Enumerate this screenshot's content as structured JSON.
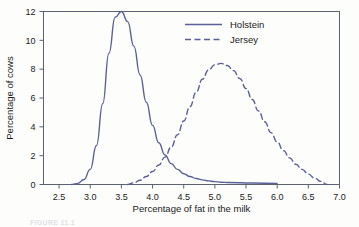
{
  "figure": {
    "background_color": "#fdfdfc",
    "caption_partial": "FIGURE 11.1"
  },
  "chart_data": {
    "type": "line",
    "title": "",
    "xlabel": "Percentage of fat in the milk",
    "ylabel": "Percentage of cows",
    "xlim": [
      2.25,
      7.0
    ],
    "ylim": [
      0,
      12
    ],
    "xticks": [
      2.5,
      3.0,
      3.5,
      4.0,
      4.5,
      5.0,
      5.5,
      6.0,
      6.5,
      7.0
    ],
    "xtick_labels": [
      "2.5",
      "3.0",
      "3.5",
      "4.0",
      "4.5",
      "5.0",
      "5.5",
      "6.0",
      "6.5",
      "7.0"
    ],
    "yticks": [
      0,
      2,
      4,
      6,
      8,
      10,
      12
    ],
    "ytick_labels": [
      "0",
      "2",
      "4",
      "6",
      "8",
      "10",
      "12"
    ],
    "grid": false,
    "legend_position": "top-right",
    "line_color": "#5a6199",
    "axis_color": "#5c6270",
    "series": [
      {
        "name": "Holstein",
        "style": "solid",
        "color": "#5a6199",
        "mean": 3.5,
        "sd": 0.23,
        "peak_x": 3.5,
        "peak_y": 12,
        "x": [
          2.7,
          2.8,
          2.9,
          3.0,
          3.1,
          3.2,
          3.3,
          3.4,
          3.5,
          3.6,
          3.7,
          3.8,
          3.9,
          4.0,
          4.1,
          4.2,
          4.3,
          4.4,
          4.5,
          4.6,
          4.7,
          4.8,
          4.9,
          5.0,
          5.1,
          5.2,
          5.6,
          6.0
        ],
        "values": [
          0.0,
          0.08,
          0.35,
          1.05,
          2.7,
          5.6,
          9.1,
          11.6,
          12.0,
          11.3,
          9.6,
          7.6,
          5.7,
          4.1,
          2.9,
          2.05,
          1.45,
          1.05,
          0.75,
          0.55,
          0.42,
          0.32,
          0.25,
          0.2,
          0.16,
          0.14,
          0.1,
          0.08
        ]
      },
      {
        "name": "Jersey",
        "style": "dashed",
        "color": "#5a6199",
        "mean": 5.1,
        "sd": 0.47,
        "peak_x": 5.1,
        "peak_y": 8.4,
        "x": [
          3.6,
          3.7,
          3.8,
          3.9,
          4.0,
          4.1,
          4.2,
          4.3,
          4.4,
          4.5,
          4.6,
          4.7,
          4.8,
          4.9,
          5.0,
          5.1,
          5.2,
          5.3,
          5.4,
          5.5,
          5.6,
          5.7,
          5.8,
          5.9,
          6.0,
          6.1,
          6.2,
          6.3,
          6.4,
          6.5,
          6.6,
          6.7,
          6.8
        ],
        "values": [
          0.0,
          0.12,
          0.3,
          0.55,
          0.9,
          1.35,
          1.9,
          2.6,
          3.45,
          4.4,
          5.4,
          6.4,
          7.3,
          7.95,
          8.3,
          8.4,
          8.25,
          7.9,
          7.35,
          6.65,
          5.9,
          5.1,
          4.35,
          3.6,
          2.95,
          2.35,
          1.85,
          1.4,
          1.05,
          0.72,
          0.45,
          0.22,
          0.0
        ]
      }
    ]
  },
  "axis": {
    "x_title": "Percentage of fat in the milk",
    "y_title": "Percentage of cows"
  },
  "legend": {
    "entries": [
      {
        "label": "Holstein",
        "style": "solid"
      },
      {
        "label": "Jersey",
        "style": "dashed"
      }
    ]
  }
}
